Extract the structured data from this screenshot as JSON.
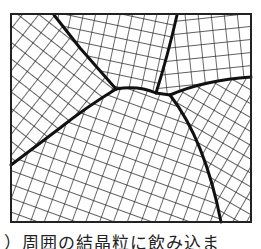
{
  "figure": {
    "type": "polycrystalline grain structure diagram",
    "frame": {
      "x": 11,
      "y": 14,
      "width": 240,
      "height": 208
    },
    "line_color": "#1a1a1a",
    "background": "#ffffff",
    "grain_count": 6,
    "grains": [
      {
        "id": "top-left",
        "lattice_angle_deg": 38,
        "spacing": 13
      },
      {
        "id": "top-middle",
        "lattice_angle_deg": 12,
        "spacing": 12
      },
      {
        "id": "top-right",
        "lattice_angle_deg": -6,
        "spacing": 13
      },
      {
        "id": "right",
        "lattice_angle_deg": 30,
        "spacing": 12
      },
      {
        "id": "bottom-center",
        "lattice_angle_deg": 20,
        "spacing": 13
      },
      {
        "id": "bottom-left",
        "lattice_angle_deg": 20,
        "spacing": 13
      }
    ]
  },
  "caption": {
    "text": "）周囲の結晶粒に飲み込ま"
  }
}
